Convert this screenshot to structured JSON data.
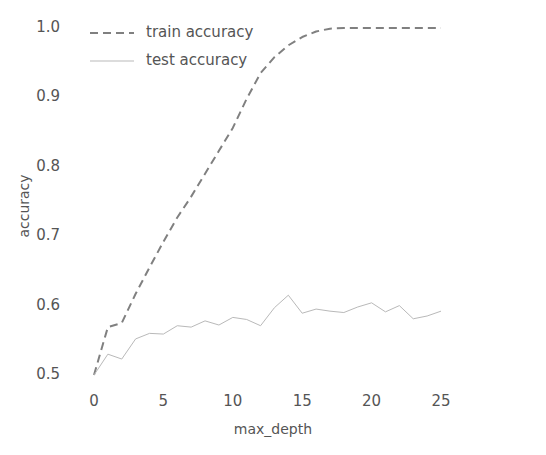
{
  "chart_data": {
    "type": "line",
    "title": "",
    "xlabel": "max_depth",
    "ylabel": "accuracy",
    "xlim": [
      -1.2,
      26.2
    ],
    "ylim": [
      0.485,
      1.015
    ],
    "xticks": [
      0,
      5,
      10,
      15,
      20,
      25
    ],
    "xtick_labels": [
      "0",
      "5",
      "10",
      "15",
      "20",
      "25"
    ],
    "yticks": [
      0.5,
      0.6,
      0.7,
      0.8,
      0.9,
      1.0
    ],
    "ytick_labels": [
      "0.5",
      "0.6",
      "0.7",
      "0.8",
      "0.9",
      "1.0"
    ],
    "grid": false,
    "legend_position": "upper left",
    "x": [
      0,
      1,
      2,
      3,
      4,
      5,
      6,
      7,
      8,
      9,
      10,
      11,
      12,
      13,
      14,
      15,
      16,
      17,
      18,
      19,
      20,
      21,
      22,
      23,
      24,
      25
    ],
    "series": [
      {
        "name": "train accuracy",
        "linestyle": "dashed",
        "color": "#808080",
        "linewidth": 2.0,
        "values": [
          0.5,
          0.569,
          0.575,
          0.617,
          0.655,
          0.692,
          0.727,
          0.757,
          0.79,
          0.823,
          0.856,
          0.898,
          0.935,
          0.958,
          0.975,
          0.987,
          0.995,
          0.999,
          1.0,
          1.0,
          1.0,
          1.0,
          1.0,
          1.0,
          1.0,
          1.0
        ]
      },
      {
        "name": "test accuracy",
        "linestyle": "solid",
        "color": "#b9b9b9",
        "linewidth": 1.0,
        "values": [
          0.5,
          0.53,
          0.523,
          0.552,
          0.56,
          0.559,
          0.571,
          0.569,
          0.578,
          0.572,
          0.583,
          0.58,
          0.571,
          0.597,
          0.615,
          0.589,
          0.595,
          0.592,
          0.59,
          0.598,
          0.604,
          0.591,
          0.6,
          0.581,
          0.585,
          0.592
        ]
      }
    ],
    "legend_entries": [
      {
        "label": "train accuracy",
        "linestyle": "dashed",
        "color": "#808080"
      },
      {
        "label": "test accuracy",
        "linestyle": "solid",
        "color": "#b9b9b9"
      }
    ]
  },
  "colors": {
    "background": "#ffffff",
    "text": "#555555",
    "train_line": "#808080",
    "test_line": "#b9b9b9"
  }
}
